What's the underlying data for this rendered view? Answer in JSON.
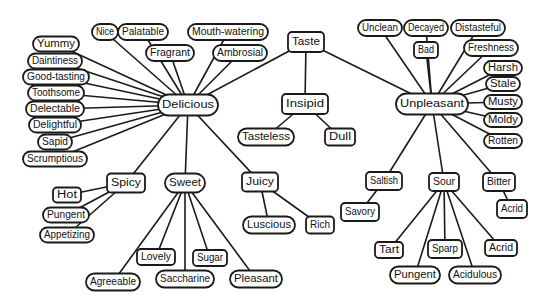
{
  "colors": {
    "stroke": "#1a1a1a",
    "node_fill": "#ffffff",
    "text": "#111111",
    "background": "#ffffff"
  },
  "nodes": [
    {
      "id": "taste",
      "label": "Taste",
      "shape": "rect"
    },
    {
      "id": "delicious",
      "label": "Delicious",
      "shape": "pill"
    },
    {
      "id": "insipid",
      "label": "Insipid",
      "shape": "rect"
    },
    {
      "id": "unpleasant",
      "label": "Unpleasant",
      "shape": "pill"
    },
    {
      "id": "nice",
      "label": "Nice",
      "shape": "pill"
    },
    {
      "id": "palatable",
      "label": "Palatable",
      "shape": "pill"
    },
    {
      "id": "mouth_watering",
      "label": "Mouth-watering",
      "shape": "pill"
    },
    {
      "id": "fragrant",
      "label": "Fragrant",
      "shape": "pill"
    },
    {
      "id": "ambrosial",
      "label": "Ambrosial",
      "shape": "pill"
    },
    {
      "id": "yummy",
      "label": "Yummy",
      "shape": "pill"
    },
    {
      "id": "daintiness",
      "label": "Daintiness",
      "shape": "pill"
    },
    {
      "id": "good_tasting",
      "label": "Good-tasting",
      "shape": "pill"
    },
    {
      "id": "toothsome",
      "label": "Toothsome",
      "shape": "pill"
    },
    {
      "id": "delectable",
      "label": "Delectable",
      "shape": "pill"
    },
    {
      "id": "delightful",
      "label": "Delightful",
      "shape": "pill"
    },
    {
      "id": "sapid",
      "label": "Sapid",
      "shape": "pill"
    },
    {
      "id": "scrumptious",
      "label": "Scrumptious",
      "shape": "pill"
    },
    {
      "id": "spicy",
      "label": "Spicy",
      "shape": "rect"
    },
    {
      "id": "sweet",
      "label": "Sweet",
      "shape": "pill"
    },
    {
      "id": "juicy",
      "label": "Juicy",
      "shape": "rect"
    },
    {
      "id": "hot",
      "label": "Hot",
      "shape": "rect"
    },
    {
      "id": "pungent_l",
      "label": "Pungent",
      "shape": "pill"
    },
    {
      "id": "appetizing",
      "label": "Appetizing",
      "shape": "pill"
    },
    {
      "id": "lovely",
      "label": "Lovely",
      "shape": "rect"
    },
    {
      "id": "sugar",
      "label": "Sugar",
      "shape": "rect"
    },
    {
      "id": "agreeable",
      "label": "Agreeable",
      "shape": "pill"
    },
    {
      "id": "saccharine",
      "label": "Saccharine",
      "shape": "pill"
    },
    {
      "id": "pleasant",
      "label": "Pleasant",
      "shape": "pill"
    },
    {
      "id": "luscious",
      "label": "Luscious",
      "shape": "pill"
    },
    {
      "id": "rich",
      "label": "Rich",
      "shape": "rect"
    },
    {
      "id": "tasteless",
      "label": "Tasteless",
      "shape": "pill"
    },
    {
      "id": "dull",
      "label": "Dull",
      "shape": "rect"
    },
    {
      "id": "unclean",
      "label": "Unclean",
      "shape": "pill"
    },
    {
      "id": "decayed",
      "label": "Decayed",
      "shape": "pill"
    },
    {
      "id": "distasteful",
      "label": "Distasteful",
      "shape": "pill"
    },
    {
      "id": "bad",
      "label": "Bad",
      "shape": "rect"
    },
    {
      "id": "freshness",
      "label": "Freshness",
      "shape": "pill"
    },
    {
      "id": "harsh",
      "label": "Harsh",
      "shape": "pill"
    },
    {
      "id": "stale",
      "label": "Stale",
      "shape": "pill"
    },
    {
      "id": "musty",
      "label": "Musty",
      "shape": "pill"
    },
    {
      "id": "moldy",
      "label": "Moldy",
      "shape": "pill"
    },
    {
      "id": "rotten",
      "label": "Rotten",
      "shape": "pill"
    },
    {
      "id": "saltish",
      "label": "Saltish",
      "shape": "rect"
    },
    {
      "id": "sour",
      "label": "Sour",
      "shape": "rect"
    },
    {
      "id": "bitter",
      "label": "Bitter",
      "shape": "rect"
    },
    {
      "id": "savory",
      "label": "Savory",
      "shape": "rect"
    },
    {
      "id": "acrid_b",
      "label": "Acrid",
      "shape": "rect"
    },
    {
      "id": "tart",
      "label": "Tart",
      "shape": "rect"
    },
    {
      "id": "sparp",
      "label": "Sparp",
      "shape": "rect"
    },
    {
      "id": "acrid_s",
      "label": "Acrid",
      "shape": "rect"
    },
    {
      "id": "pungent_s",
      "label": "Pungent",
      "shape": "pill"
    },
    {
      "id": "acidulous",
      "label": "Acidulous",
      "shape": "pill"
    }
  ],
  "edges": [
    [
      "taste",
      "delicious"
    ],
    [
      "taste",
      "insipid"
    ],
    [
      "taste",
      "unpleasant"
    ],
    [
      "delicious",
      "nice"
    ],
    [
      "delicious",
      "palatable"
    ],
    [
      "delicious",
      "mouth_watering"
    ],
    [
      "delicious",
      "fragrant"
    ],
    [
      "delicious",
      "ambrosial"
    ],
    [
      "delicious",
      "yummy"
    ],
    [
      "delicious",
      "daintiness"
    ],
    [
      "delicious",
      "good_tasting"
    ],
    [
      "delicious",
      "toothsome"
    ],
    [
      "delicious",
      "delectable"
    ],
    [
      "delicious",
      "delightful"
    ],
    [
      "delicious",
      "sapid"
    ],
    [
      "delicious",
      "scrumptious"
    ],
    [
      "delicious",
      "spicy"
    ],
    [
      "delicious",
      "sweet"
    ],
    [
      "delicious",
      "juicy"
    ],
    [
      "spicy",
      "hot"
    ],
    [
      "spicy",
      "pungent_l"
    ],
    [
      "spicy",
      "appetizing"
    ],
    [
      "sweet",
      "lovely"
    ],
    [
      "sweet",
      "sugar"
    ],
    [
      "sweet",
      "agreeable"
    ],
    [
      "sweet",
      "saccharine"
    ],
    [
      "sweet",
      "pleasant"
    ],
    [
      "juicy",
      "luscious"
    ],
    [
      "juicy",
      "rich"
    ],
    [
      "insipid",
      "tasteless"
    ],
    [
      "insipid",
      "dull"
    ],
    [
      "unpleasant",
      "unclean"
    ],
    [
      "unpleasant",
      "decayed"
    ],
    [
      "unpleasant",
      "distasteful"
    ],
    [
      "unpleasant",
      "bad"
    ],
    [
      "unpleasant",
      "freshness"
    ],
    [
      "unpleasant",
      "harsh"
    ],
    [
      "unpleasant",
      "stale"
    ],
    [
      "unpleasant",
      "musty"
    ],
    [
      "unpleasant",
      "moldy"
    ],
    [
      "unpleasant",
      "rotten"
    ],
    [
      "unpleasant",
      "saltish"
    ],
    [
      "unpleasant",
      "sour"
    ],
    [
      "unpleasant",
      "bitter"
    ],
    [
      "saltish",
      "savory"
    ],
    [
      "bitter",
      "acrid_b"
    ],
    [
      "sour",
      "tart"
    ],
    [
      "sour",
      "pungent_s"
    ],
    [
      "sour",
      "sparp"
    ],
    [
      "sour",
      "acidulous"
    ],
    [
      "sour",
      "acrid_s"
    ]
  ]
}
